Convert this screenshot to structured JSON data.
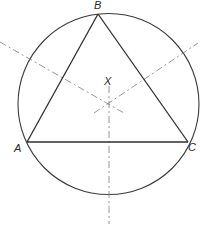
{
  "diagram": {
    "vertices": [
      {
        "id": "A",
        "label": "A"
      },
      {
        "id": "B",
        "label": "B"
      },
      {
        "id": "C",
        "label": "C"
      }
    ],
    "center_label": "X",
    "elements": [
      "circumcircle",
      "triangle ABC",
      "perpendicular bisector of AB",
      "perpendicular bisector of BC",
      "perpendicular bisector of AC"
    ],
    "colors": {
      "background": "#ffffff",
      "solid_line": "#2e2e2e",
      "dashed_line": "#8a8a8a",
      "label": "#2a2a2a"
    }
  }
}
